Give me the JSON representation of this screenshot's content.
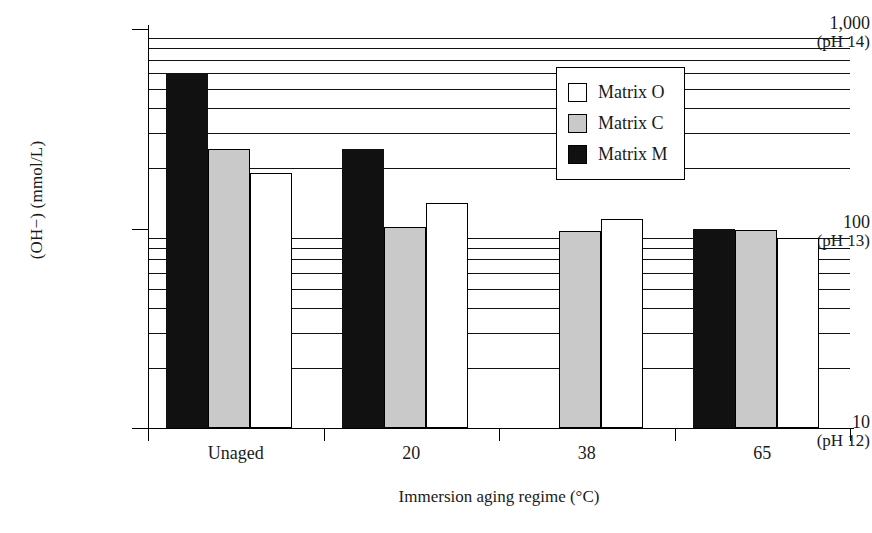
{
  "chart_data": {
    "type": "bar",
    "title": "",
    "xlabel": "Immersion aging regime (°C)",
    "ylabel": "(OH−) (mmol/L)",
    "yscale": "log",
    "ylim": [
      10,
      1000
    ],
    "grid": true,
    "legend_position": "upper-right",
    "categories": [
      "Unaged",
      "20",
      "38",
      "65"
    ],
    "ytick_labels": [
      {
        "value": 1000,
        "main": "1,000",
        "ph": "(pH 14)"
      },
      {
        "value": 100,
        "main": "100",
        "ph": "(pH 13)"
      },
      {
        "value": 10,
        "main": "10",
        "ph": "(pH 12)"
      }
    ],
    "series": [
      {
        "name": "Matrix M",
        "key": "series-m",
        "color": "#111111",
        "values": [
          600,
          250,
          null,
          100
        ]
      },
      {
        "name": "Matrix C",
        "key": "series-c",
        "color": "#c9c9c9",
        "values": [
          250,
          102,
          97,
          98
        ]
      },
      {
        "name": "Matrix O",
        "key": "series-o",
        "color": "#ffffff",
        "values": [
          190,
          135,
          112,
          90
        ]
      }
    ],
    "series_order_in_group": [
      "series-m",
      "series-c",
      "series-o"
    ],
    "gridline_values": [
      900,
      800,
      700,
      600,
      500,
      400,
      300,
      200,
      90,
      80,
      70,
      60,
      50,
      40,
      30,
      20
    ]
  },
  "legend": {
    "items": [
      {
        "label": "Matrix O",
        "key": "series-o"
      },
      {
        "label": "Matrix C",
        "key": "series-c"
      },
      {
        "label": "Matrix M",
        "key": "series-m"
      }
    ]
  }
}
